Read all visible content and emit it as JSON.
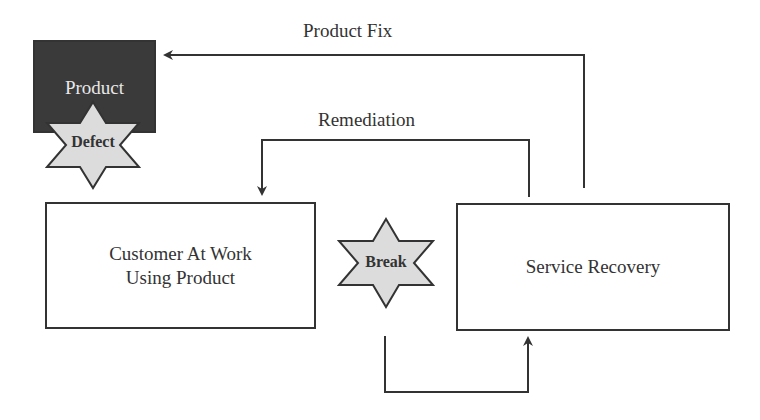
{
  "diagram": {
    "nodes": {
      "product": {
        "label": "Product"
      },
      "customer": {
        "line1": "Customer At Work",
        "line2": "Using Product"
      },
      "service_recovery": {
        "label": "Service Recovery"
      }
    },
    "badges": {
      "defect": {
        "label": "Defect",
        "shape": "six-point-star"
      },
      "break": {
        "label": "Break",
        "shape": "six-point-star"
      }
    },
    "edges": {
      "product_fix": {
        "label": "Product Fix",
        "from": "Service Recovery",
        "to": "Product"
      },
      "remediation": {
        "label": "Remediation",
        "from": "Service Recovery",
        "to": "Customer At Work Using Product"
      },
      "break_flow": {
        "label": "",
        "from": "Break",
        "to": "Service Recovery"
      }
    },
    "colors": {
      "product_fill": "#3a3a3a",
      "star_fill": "#dcdcdc",
      "stroke": "#333333",
      "background": "#ffffff"
    }
  }
}
